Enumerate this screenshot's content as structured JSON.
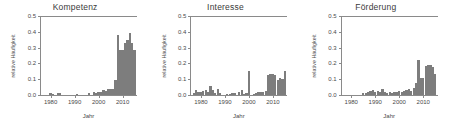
{
  "figure": {
    "ylabel": "relative Häufigkeit",
    "xlabel": "Jahr"
  },
  "chart_data": [
    {
      "type": "bar",
      "title": "Kompetenz",
      "xlabel": "Jahr",
      "ylabel": "relative Häufigkeit",
      "ylim": [
        0.0,
        0.5
      ],
      "xlim": [
        1976,
        2016
      ],
      "ytick_labels": [
        "0.0",
        "0.1",
        "0.2",
        "0.3",
        "0.4",
        "0.5"
      ],
      "ytick_values": [
        0.0,
        0.1,
        0.2,
        0.3,
        0.4,
        0.5
      ],
      "xtick_labels": [
        "1980",
        "1990",
        "2000",
        "2010"
      ],
      "xtick_values": [
        1980,
        1990,
        2000,
        2010
      ],
      "grid": false,
      "legend": null,
      "bar_color": "#7d7d7d",
      "x": [
        1977,
        1978,
        1979,
        1980,
        1981,
        1982,
        1983,
        1984,
        1985,
        1986,
        1987,
        1988,
        1989,
        1990,
        1991,
        1992,
        1993,
        1994,
        1995,
        1996,
        1997,
        1998,
        1999,
        2000,
        2001,
        2002,
        2003,
        2004,
        2005,
        2006,
        2007,
        2008,
        2009,
        2010,
        2011,
        2012,
        2013,
        2014,
        2015
      ],
      "values": [
        0.0,
        0.0,
        0.0,
        0.012,
        0.009,
        0.0,
        0.012,
        0.01,
        0.0,
        0.0,
        0.0,
        0.0,
        0.0,
        0.0,
        0.009,
        0.0,
        0.0,
        0.0,
        0.0,
        0.012,
        0.0,
        0.016,
        0.014,
        0.02,
        0.018,
        0.03,
        0.026,
        0.036,
        0.04,
        0.036,
        0.095,
        0.38,
        0.285,
        0.287,
        0.33,
        0.35,
        0.39,
        0.33,
        0.285
      ]
    },
    {
      "type": "bar",
      "title": "Interesse",
      "xlabel": "Jahr",
      "ylabel": "relative Häufigkeit",
      "ylim": [
        0.0,
        0.5
      ],
      "xlim": [
        1976,
        2016
      ],
      "ytick_labels": [
        "0.0",
        "0.1",
        "0.2",
        "0.3",
        "0.4",
        "0.5"
      ],
      "ytick_values": [
        0.0,
        0.1,
        0.2,
        0.3,
        0.4,
        0.5
      ],
      "xtick_labels": [
        "1980",
        "1990",
        "2000",
        "2010"
      ],
      "xtick_values": [
        1980,
        1990,
        2000,
        2010
      ],
      "grid": false,
      "legend": null,
      "bar_color": "#7d7d7d",
      "x": [
        1977,
        1978,
        1979,
        1980,
        1981,
        1982,
        1983,
        1984,
        1985,
        1986,
        1987,
        1988,
        1989,
        1990,
        1991,
        1992,
        1993,
        1994,
        1995,
        1996,
        1997,
        1998,
        1999,
        2000,
        2001,
        2002,
        2003,
        2004,
        2005,
        2006,
        2007,
        2008,
        2009,
        2010,
        2011,
        2012,
        2013,
        2014,
        2015
      ],
      "values": [
        0.012,
        0.03,
        0.018,
        0.022,
        0.025,
        0.03,
        0.018,
        0.055,
        0.03,
        0.014,
        0.036,
        0.01,
        0.0,
        0.0,
        0.008,
        0.006,
        0.012,
        0.01,
        0.0,
        0.022,
        0.03,
        0.008,
        0.01,
        0.15,
        0.0,
        0.008,
        0.012,
        0.018,
        0.02,
        0.022,
        0.028,
        0.125,
        0.13,
        0.135,
        0.125,
        0.095,
        0.11,
        0.1,
        0.15
      ]
    },
    {
      "type": "bar",
      "title": "Förderung",
      "xlabel": "Jahr",
      "ylabel": "relative Häufigkeit",
      "ylim": [
        0.0,
        0.5
      ],
      "xlim": [
        1976,
        2016
      ],
      "ytick_labels": [
        "0.0",
        "0.1",
        "0.2",
        "0.3",
        "0.4",
        "0.5"
      ],
      "ytick_values": [
        0.0,
        0.1,
        0.2,
        0.3,
        0.4,
        0.5
      ],
      "xtick_labels": [
        "1980",
        "1990",
        "2000",
        "2010"
      ],
      "xtick_values": [
        1980,
        1990,
        2000,
        2010
      ],
      "grid": false,
      "legend": null,
      "bar_color": "#7d7d7d",
      "x": [
        1977,
        1978,
        1979,
        1980,
        1981,
        1982,
        1983,
        1984,
        1985,
        1986,
        1987,
        1988,
        1989,
        1990,
        1991,
        1992,
        1993,
        1994,
        1995,
        1996,
        1997,
        1998,
        1999,
        2000,
        2001,
        2002,
        2003,
        2004,
        2005,
        2006,
        2007,
        2008,
        2009,
        2010,
        2011,
        2012,
        2013,
        2014,
        2015
      ],
      "values": [
        0.0,
        0.0,
        0.0,
        0.0,
        0.0,
        0.0,
        0.0,
        0.0,
        0.01,
        0.012,
        0.018,
        0.025,
        0.03,
        0.018,
        0.028,
        0.022,
        0.038,
        0.02,
        0.012,
        0.018,
        0.014,
        0.02,
        0.022,
        0.024,
        0.018,
        0.024,
        0.03,
        0.038,
        0.028,
        0.045,
        0.075,
        0.222,
        0.11,
        0.105,
        0.185,
        0.19,
        0.192,
        0.175,
        0.135
      ]
    }
  ]
}
